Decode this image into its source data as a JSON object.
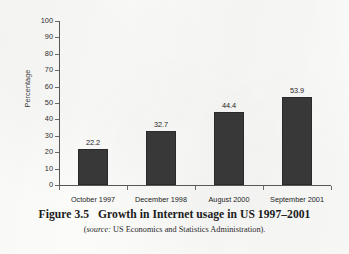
{
  "figure": {
    "caption_number": "Figure 3.5",
    "caption_title": "Growth in Internet usage in US 1997–2001",
    "source_keyword": "source:",
    "source_text": " US Economics and Statistics Administration).",
    "source_open_paren": "(",
    "colors": {
      "bar_fill": "#383838",
      "bar_stroke": "#2a2a2a",
      "axis": "#575757",
      "text": "#262626",
      "paper": "#fbfbfa"
    }
  },
  "chart_data": {
    "type": "bar",
    "title": "Growth in Internet usage in US 1997–2001",
    "xlabel": "",
    "ylabel": "Percentage",
    "categories": [
      "October 1997",
      "December 1998",
      "August 2000",
      "September 2001"
    ],
    "values": [
      22.2,
      32.7,
      44.4,
      53.9
    ],
    "value_labels": [
      "22.2",
      "32.7",
      "44.4",
      "53.9"
    ],
    "ylim": [
      0,
      100
    ],
    "ytick_values": [
      0,
      10,
      20,
      30,
      40,
      50,
      60,
      70,
      80,
      90,
      100
    ],
    "ytick_labels": [
      "0",
      "10",
      "20",
      "30",
      "40",
      "50",
      "60",
      "70",
      "80",
      "90",
      "100"
    ],
    "grid": false,
    "legend": false,
    "series": [
      {
        "name": "Percentage of US population using the Internet",
        "values": [
          22.2,
          32.7,
          44.4,
          53.9
        ]
      }
    ]
  }
}
